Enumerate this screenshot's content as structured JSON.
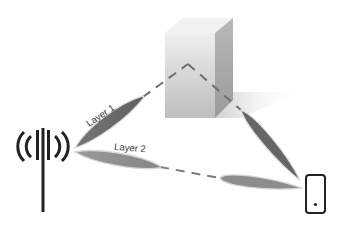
{
  "diagram": {
    "type": "wireless multi-layer beamforming illustration",
    "labels": {
      "layer1": "Layer 1",
      "layer2": "Layer 2"
    },
    "nodes": [
      {
        "id": "base-station",
        "icon": "antenna-tower-icon"
      },
      {
        "id": "obstacle",
        "icon": "building-block"
      },
      {
        "id": "user-device",
        "icon": "smartphone-icon"
      }
    ],
    "paths": [
      {
        "layer": "Layer 1",
        "route": [
          "base-station",
          "obstacle (reflection)",
          "user-device"
        ]
      },
      {
        "layer": "Layer 2",
        "route": [
          "base-station",
          "user-device (direct)"
        ]
      }
    ],
    "colors": {
      "beam_layer1": "#6b6b6b",
      "beam_layer2": "#8e8e8e",
      "beam_outline": "#d9d9d9",
      "dash": "#6e6e6e",
      "block_front": "#c9c9c9",
      "block_side": "#a9a9a9",
      "block_top": "#eeeeee",
      "icon": "#222222"
    }
  }
}
